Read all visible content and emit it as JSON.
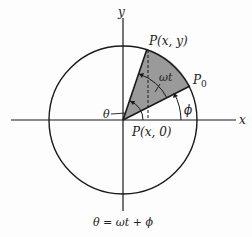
{
  "diagram": {
    "axes": {
      "x_label": "x",
      "y_label": "y"
    },
    "points": {
      "p_xy": "P(x, y)",
      "p0_main": "P",
      "p0_sub": "0",
      "p_x0": "P(x, 0)"
    },
    "angles": {
      "omega_t": "ωt",
      "theta": "θ",
      "phi": "ϕ"
    },
    "equation": "θ = ωt + ϕ",
    "colors": {
      "line": "#1a1a1a",
      "sector_fill": "#9a9a9a"
    }
  }
}
